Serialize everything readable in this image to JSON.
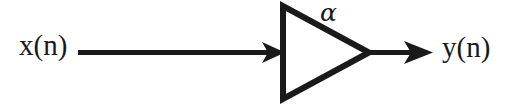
{
  "diagram": {
    "type": "signal-flow-block-diagram",
    "background_color": "#ffffff",
    "stroke_color": "#1a1a1a",
    "labels": {
      "input_signal": "x(n)",
      "output_signal": "y(n)",
      "gain": "α"
    },
    "nodes": [
      {
        "name": "input-label",
        "text": "x(n)",
        "x": 19,
        "y": 31
      },
      {
        "name": "input-arrow",
        "text": "",
        "from_x": 78,
        "to_x": 281,
        "y": 52
      },
      {
        "name": "amplifier-triangle",
        "text": "α",
        "left_x": 281,
        "apex_x": 370,
        "top_y": 5,
        "bottom_y": 100
      },
      {
        "name": "gain-label",
        "text": "α",
        "x": 320,
        "y": 0
      },
      {
        "name": "output-arrow",
        "text": "",
        "from_x": 370,
        "to_x": 433,
        "y": 52
      },
      {
        "name": "output-label",
        "text": "y(n)",
        "x": 442,
        "y": 33
      }
    ]
  }
}
